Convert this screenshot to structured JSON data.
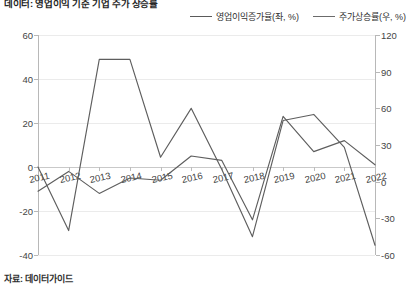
{
  "title": "데이터: 영업이익 기준 기업 주가 상승률",
  "source": "자료: 데이터가이드",
  "legend": {
    "position": "top-right",
    "items": [
      {
        "label": "영업이익증가율(좌, %)",
        "color": "#5a5a5a",
        "axis": "left"
      },
      {
        "label": "주가상승률(우, %)",
        "color": "#6b6b6b",
        "axis": "right"
      }
    ]
  },
  "chart_data": {
    "type": "line",
    "title": "데이터: 영업이익 기준 기업 주가 상승률",
    "xlabel": "",
    "ylabel": "",
    "grid": true,
    "categories": [
      "2011",
      "2012",
      "2013",
      "2014",
      "2015",
      "2016",
      "2017",
      "2018",
      "2019",
      "2020",
      "2021",
      "2022"
    ],
    "left_axis": {
      "label": "영업이익증가율(좌, %)",
      "ylim": [
        -40,
        60
      ],
      "ticks": [
        60,
        40,
        20,
        0,
        -20,
        -40
      ]
    },
    "right_axis": {
      "label": "주가상승률(우, %)",
      "ylim": [
        -60,
        120
      ],
      "ticks": [
        120,
        90,
        60,
        30,
        0,
        -30,
        -60
      ]
    },
    "series": [
      {
        "name": "영업이익증가율(좌, %)",
        "axis": "left",
        "color": "#5e5e5e",
        "values": [
          -11,
          -2,
          -12,
          -5,
          -6,
          5,
          3,
          -24,
          23,
          7,
          12,
          1
        ]
      },
      {
        "name": "주가상승률(우, %)",
        "axis": "right",
        "color": "#5e5e5e",
        "values": [
          12,
          -40,
          100,
          100,
          20,
          60,
          10,
          -45,
          50,
          55,
          28,
          -52
        ]
      }
    ]
  }
}
